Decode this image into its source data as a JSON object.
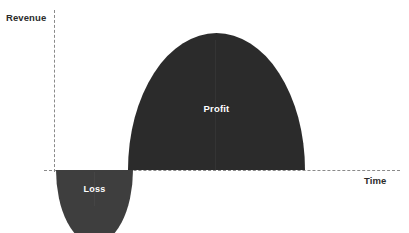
{
  "chart_data": {
    "type": "area",
    "title": "",
    "xlabel": "Time",
    "ylabel": "Revenue",
    "grid": false,
    "legend": "none",
    "axes": {
      "x": {
        "label": "Time",
        "style": "dashed",
        "origin_px": 54,
        "baseline_px": 170
      },
      "y": {
        "label": "Revenue",
        "style": "dashed"
      }
    },
    "regions": [
      {
        "name": "Loss",
        "label": "Loss",
        "sign": "negative",
        "side": "below-axis",
        "shape": "half-ellipse",
        "color": "#3e3e3e",
        "label_color": "#ffffff",
        "x_start": 56,
        "x_end": 133,
        "extent_px": 37
      },
      {
        "name": "Profit",
        "label": "Profit",
        "sign": "positive",
        "side": "above-axis",
        "shape": "half-ellipse",
        "color": "#2b2b2b",
        "label_color": "#ffffff",
        "x_start": 128,
        "x_end": 305,
        "extent_px": 137
      }
    ]
  },
  "diagram": {
    "background": "#ffffff",
    "axis_color": "#8a8a8a",
    "axis_label_color": "#2b2b2b",
    "y_axis_label": "Revenue",
    "x_axis_label": "Time",
    "profit_label": "Profit",
    "loss_label": "Loss"
  }
}
